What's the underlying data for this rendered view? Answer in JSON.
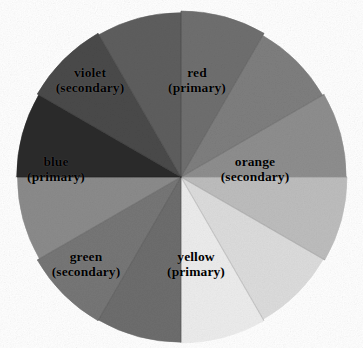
{
  "figure": {
    "background_color": "#ffffff",
    "note": "grayscale reproduction of a twelve-segment painted color wheel"
  },
  "wheel": {
    "center_x": 181,
    "center_y": 177,
    "radius": 166,
    "segment_count": 12,
    "segments": [
      {
        "name": "red",
        "role": "primary",
        "start_deg": -90,
        "end_deg": -60,
        "color": "#6f6f6f",
        "labeled": true
      },
      {
        "name": "red-orange",
        "role": "tertiary",
        "start_deg": -60,
        "end_deg": -30,
        "color": "#7e7e7e",
        "labeled": false
      },
      {
        "name": "orange",
        "role": "secondary",
        "start_deg": -30,
        "end_deg": 0,
        "color": "#8e8e8e",
        "labeled": true
      },
      {
        "name": "yellow-orange",
        "role": "tertiary",
        "start_deg": 0,
        "end_deg": 30,
        "color": "#bdbdbd",
        "labeled": false
      },
      {
        "name": "yellow",
        "role": "primary",
        "start_deg": 30,
        "end_deg": 60,
        "color": "#dcdcdc",
        "labeled": true
      },
      {
        "name": "yellow-2",
        "role": "tertiary",
        "start_deg": 60,
        "end_deg": 90,
        "color": "#ececec",
        "labeled": false
      },
      {
        "name": "yellow-green",
        "role": "tertiary",
        "start_deg": 90,
        "end_deg": 120,
        "color": "#6d6d6d",
        "labeled": false
      },
      {
        "name": "green",
        "role": "secondary",
        "start_deg": 120,
        "end_deg": 150,
        "color": "#767676",
        "labeled": true
      },
      {
        "name": "blue-green",
        "role": "tertiary",
        "start_deg": 150,
        "end_deg": 180,
        "color": "#8b8b8b",
        "labeled": false
      },
      {
        "name": "blue",
        "role": "primary",
        "start_deg": 180,
        "end_deg": 210,
        "color": "#2c2c2c",
        "labeled": true
      },
      {
        "name": "blue-violet",
        "role": "tertiary",
        "start_deg": 210,
        "end_deg": 240,
        "color": "#4a4a4a",
        "labeled": false
      },
      {
        "name": "violet",
        "role": "secondary",
        "start_deg": 240,
        "end_deg": 270,
        "color": "#5e5e5e",
        "labeled": true
      }
    ]
  },
  "labels": {
    "red": {
      "name": "red",
      "role": "(primary)"
    },
    "orange": {
      "name": "orange",
      "role": "(secondary)"
    },
    "yellow": {
      "name": "yellow",
      "role": "(primary)"
    },
    "green": {
      "name": "green",
      "role": "(secondary)"
    },
    "blue": {
      "name": "blue",
      "role": "(primary)"
    },
    "violet": {
      "name": "violet",
      "role": "(secondary)"
    }
  },
  "chart_data": {
    "type": "pie",
    "xlabel": "",
    "ylabel": "",
    "legend_position": "none",
    "grid": false,
    "categories": [
      "red",
      "red-orange",
      "orange",
      "yellow-orange",
      "yellow",
      "yellow-light",
      "yellow-green",
      "green",
      "blue-green",
      "blue",
      "blue-violet",
      "violet"
    ],
    "values": [
      30,
      30,
      30,
      30,
      30,
      30,
      30,
      30,
      30,
      30,
      30,
      30
    ],
    "units": "degrees",
    "colors": [
      "#6f6f6f",
      "#7e7e7e",
      "#8e8e8e",
      "#bdbdbd",
      "#dcdcdc",
      "#ececec",
      "#6d6d6d",
      "#767676",
      "#8b8b8b",
      "#2c2c2c",
      "#4a4a4a",
      "#5e5e5e"
    ],
    "annotations": [
      "red (primary)",
      "orange (secondary)",
      "yellow (primary)",
      "green (secondary)",
      "blue (primary)",
      "violet (secondary)"
    ]
  }
}
